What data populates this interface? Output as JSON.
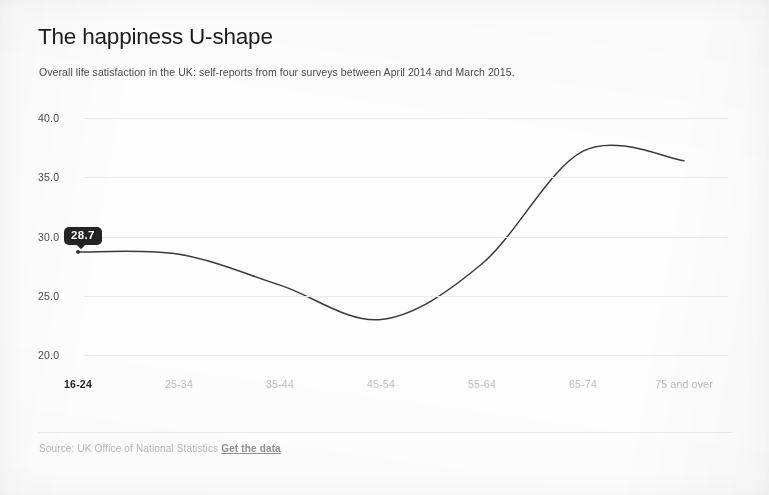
{
  "header": {
    "title": "The happiness U-shape",
    "subtitle": "Overall life satisfaction in the UK: self-reports from four surveys between April 2014 and March 2015."
  },
  "footer": {
    "source_text": "Source: UK Office of National Statistics",
    "link_label": "Get the data"
  },
  "tooltip": {
    "value": "28.7"
  },
  "axis": {
    "y_ticks": [
      "40.0",
      "35.0",
      "30.0",
      "25.0",
      "20.0"
    ],
    "x_ticks": [
      "16-24",
      "25-34",
      "35-44",
      "45-54",
      "55-64",
      "65-74",
      "75 and over"
    ]
  },
  "colors": {
    "line": "#3a3a3a",
    "gridline": "#e9eaec",
    "tooltip_bg": "#232323",
    "tooltip_text": "#ffffff",
    "active_tick": "#1f1f1f",
    "inactive_tick": "#b9bcc0",
    "title": "#1c1c1c",
    "subtitle": "#494949",
    "source": "#b4b7bb"
  },
  "chart_data": {
    "type": "line",
    "title": "The happiness U-shape",
    "subtitle": "Overall life satisfaction in the UK: self-reports from four surveys between April 2014 and March 2015.",
    "xlabel": "",
    "ylabel": "",
    "categories": [
      "16-24",
      "25-34",
      "35-44",
      "45-54",
      "55-64",
      "65-74",
      "75 and over"
    ],
    "values": [
      28.7,
      28.5,
      25.9,
      23.0,
      27.7,
      37.2,
      36.4
    ],
    "ylim": [
      20.0,
      40.0
    ],
    "y_ticks": [
      20.0,
      25.0,
      30.0,
      35.0,
      40.0
    ],
    "grid": true,
    "legend": false,
    "highlighted_category": "16-24",
    "highlighted_value": 28.7,
    "annotations": [
      {
        "label": "28.7",
        "category": "16-24",
        "value": 28.7,
        "style": "tooltip"
      }
    ]
  }
}
